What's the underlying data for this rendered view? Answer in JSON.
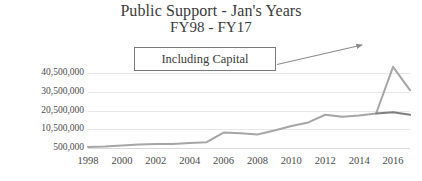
{
  "chart_data": {
    "type": "line",
    "title": "Public Support - Jan's Years",
    "subtitle": "FY98 - FY17",
    "xlabel": "",
    "ylabel": "",
    "grid": true,
    "legend": "none",
    "ylim": [
      500000,
      45500000
    ],
    "yticks": [
      500000,
      10500000,
      20500000,
      30500000,
      40500000
    ],
    "ytick_labels": [
      "500,000",
      "10,500,000",
      "20,500,000",
      "30,500,000",
      "40,500,000"
    ],
    "x": [
      1998,
      1999,
      2000,
      2001,
      2002,
      2003,
      2004,
      2005,
      2006,
      2007,
      2008,
      2009,
      2010,
      2011,
      2012,
      2013,
      2014,
      2015,
      2016,
      2017
    ],
    "xtick_labels": [
      "1998",
      "2000",
      "2002",
      "2004",
      "2006",
      "2008",
      "2010",
      "2012",
      "2014",
      "2016"
    ],
    "xticks": [
      1998,
      2000,
      2002,
      2004,
      2006,
      2008,
      2010,
      2012,
      2014,
      2016
    ],
    "series": [
      {
        "name": "Public Support including Capital",
        "color": "#a6a6a6",
        "values": [
          1000000,
          1300000,
          1900000,
          2400000,
          2600000,
          2700000,
          3200000,
          3600000,
          8800000,
          8400000,
          7700000,
          9900000,
          12300000,
          14200000,
          18300000,
          17300000,
          17900000,
          19000000,
          44000000,
          31500000
        ]
      },
      {
        "name": "Public Support operating",
        "color": "#7f7f7f",
        "values": [
          null,
          null,
          null,
          null,
          null,
          null,
          null,
          null,
          null,
          null,
          null,
          null,
          null,
          null,
          null,
          null,
          null,
          19000000,
          19600000,
          18300000
        ]
      }
    ],
    "annotations": [
      {
        "name": "including-capital-callout",
        "text": "Including Capital",
        "arrow": true
      }
    ]
  },
  "colors": {
    "series_light": "#a6a6a6",
    "series_dark": "#7f7f7f",
    "grid": "#e8e8e8",
    "text": "#3a3a3a",
    "callout_border": "#7a7a7a",
    "arrow": "#8c8c8c"
  }
}
